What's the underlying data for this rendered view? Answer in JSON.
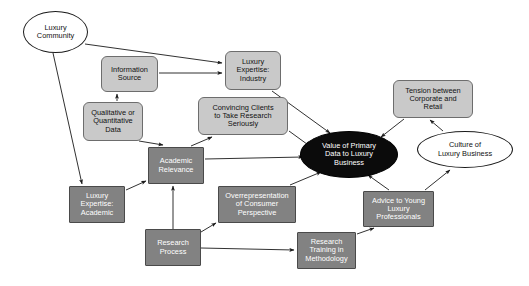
{
  "diagram": {
    "width": 529,
    "height": 286,
    "background": "#ffffff",
    "colors": {
      "box_light_fill": "#c9c9c9",
      "box_light_stroke": "#6d6d6d",
      "box_dark_fill": "#828282",
      "box_dark_stroke": "#4a4a4a",
      "ellipse_light_fill": "#ffffff",
      "ellipse_light_stroke": "#1a1a1a",
      "ellipse_dark_fill": "#0b0b0b",
      "text_dark": "#111111",
      "text_light": "#ffffff",
      "edge_stroke": "#1a1a1a"
    },
    "nodes": [
      {
        "id": "luxury-community",
        "label": "Luxury\nCommunity",
        "shape": "ellipse",
        "style": "ellipse-light",
        "x": 23,
        "y": 11,
        "w": 65,
        "h": 42
      },
      {
        "id": "information-source",
        "label": "Information\nSource",
        "shape": "rounded-rect",
        "style": "box-light",
        "x": 101,
        "y": 56,
        "w": 57,
        "h": 36
      },
      {
        "id": "qualitative-or-quantitative-data",
        "label": "Qualitative or\nQuantitative\nData",
        "shape": "rounded-rect",
        "style": "box-light",
        "x": 83,
        "y": 102,
        "w": 60,
        "h": 39
      },
      {
        "id": "luxury-expertise-industry",
        "label": "Luxury\nExpertise:\nIndustry",
        "shape": "rounded-rect",
        "style": "box-light",
        "x": 225,
        "y": 51,
        "w": 56,
        "h": 39
      },
      {
        "id": "convincing-clients",
        "label": "Convincing Clients\nto Take Research\nSeriously",
        "shape": "rounded-rect",
        "style": "box-light",
        "x": 198,
        "y": 97,
        "w": 90,
        "h": 38
      },
      {
        "id": "tension-between-corporate-and-retail",
        "label": "Tension between\nCorporate and\nRetail",
        "shape": "rounded-rect",
        "style": "box-light",
        "x": 393,
        "y": 80,
        "w": 80,
        "h": 38
      },
      {
        "id": "value-of-primary-data",
        "label": "Value of Primary\nData to Luxury\nBusiness",
        "shape": "ellipse",
        "style": "ellipse-dark",
        "x": 300,
        "y": 131,
        "w": 98,
        "h": 47
      },
      {
        "id": "culture-of-luxury-business",
        "label": "Culture of\nLuxury Business",
        "shape": "ellipse",
        "style": "ellipse-light",
        "x": 417,
        "y": 131,
        "w": 96,
        "h": 37
      },
      {
        "id": "academic-relevance",
        "label": "Academic\nRelevance",
        "shape": "rect",
        "style": "box-dark",
        "x": 148,
        "y": 147,
        "w": 56,
        "h": 37
      },
      {
        "id": "luxury-expertise-academic",
        "label": "Luxury\nExpertise:\nAcademic",
        "shape": "rect",
        "style": "box-dark",
        "x": 69,
        "y": 186,
        "w": 56,
        "h": 37
      },
      {
        "id": "overrepresentation-of-consumer-perspective",
        "label": "Overrepresentation\nof Consumer\nPerspective",
        "shape": "rect",
        "style": "box-dark",
        "x": 218,
        "y": 186,
        "w": 78,
        "h": 37
      },
      {
        "id": "advice-to-young-luxury-professionals",
        "label": "Advice to Young\nLuxury\nProfessionals",
        "shape": "rect",
        "style": "box-dark",
        "x": 363,
        "y": 191,
        "w": 71,
        "h": 36
      },
      {
        "id": "research-process",
        "label": "Research\nProcess",
        "shape": "rect",
        "style": "box-dark",
        "x": 145,
        "y": 229,
        "w": 56,
        "h": 37
      },
      {
        "id": "research-training-in-methodology",
        "label": "Research\nTraining in\nMethodology",
        "shape": "rect",
        "style": "box-dark",
        "x": 297,
        "y": 232,
        "w": 59,
        "h": 37
      }
    ],
    "edges": [
      {
        "id": "edge-luxury-community-to-luxury-expertise-industry",
        "from": "luxury-community",
        "to": "luxury-expertise-industry",
        "path": "M 85,44 L 222,63",
        "arrow": true
      },
      {
        "id": "edge-luxury-community-to-luxury-expertise-academic",
        "from": "luxury-community",
        "to": "luxury-expertise-academic",
        "path": "M 53,53 L 82,184",
        "arrow": true
      },
      {
        "id": "edge-information-source-to-luxury-expertise-industry",
        "from": "information-source",
        "to": "luxury-expertise-industry",
        "path": "M 159,73 L 222,73",
        "arrow": true
      },
      {
        "id": "edge-qualitative-data-to-information-source",
        "from": "qualitative-or-quantitative-data",
        "to": "information-source",
        "path": "M 117,101 L 117,94",
        "arrow": true
      },
      {
        "id": "edge-qualitative-data-to-academic-relevance",
        "from": "qualitative-or-quantitative-data",
        "to": "academic-relevance",
        "path": "M 139,141 L 163,145",
        "arrow": true
      },
      {
        "id": "edge-luxury-expertise-industry-to-value",
        "from": "luxury-expertise-industry",
        "to": "value-of-primary-data",
        "path": "M 272,91 L 330,133",
        "arrow": true
      },
      {
        "id": "edge-convincing-clients-to-value",
        "from": "convincing-clients",
        "to": "value-of-primary-data",
        "path": "M 289,131 L 311,147",
        "arrow": true
      },
      {
        "id": "edge-academic-relevance-to-convincing-clients",
        "from": "academic-relevance",
        "to": "convincing-clients",
        "path": "M 191,146 L 212,137",
        "arrow": true
      },
      {
        "id": "edge-academic-relevance-to-value",
        "from": "academic-relevance",
        "to": "value-of-primary-data",
        "path": "M 205,159 L 303,157",
        "arrow": true
      },
      {
        "id": "edge-luxury-expertise-academic-to-academic-relevance",
        "from": "luxury-expertise-academic",
        "to": "academic-relevance",
        "path": "M 126,190 L 146,181",
        "arrow": true
      },
      {
        "id": "edge-research-process-to-academic-relevance",
        "from": "research-process",
        "to": "academic-relevance",
        "path": "M 173,229 L 173,186",
        "arrow": true
      },
      {
        "id": "edge-research-process-to-overrepresentation",
        "from": "research-process",
        "to": "overrepresentation-of-consumer-perspective",
        "path": "M 201,232 L 216,223",
        "arrow": true
      },
      {
        "id": "edge-research-process-to-research-training",
        "from": "research-process",
        "to": "research-training-in-methodology",
        "path": "M 201,248 L 294,250",
        "arrow": true
      },
      {
        "id": "edge-overrepresentation-to-value",
        "from": "overrepresentation-of-consumer-perspective",
        "to": "value-of-primary-data",
        "path": "M 290,185 L 321,172",
        "arrow": true
      },
      {
        "id": "edge-research-training-to-advice",
        "from": "research-training-in-methodology",
        "to": "advice-to-young-luxury-professionals",
        "path": "M 357,234 L 374,228",
        "arrow": true
      },
      {
        "id": "edge-advice-to-value",
        "from": "advice-to-young-luxury-professionals",
        "to": "value-of-primary-data",
        "path": "M 389,190 L 368,175",
        "arrow": true
      },
      {
        "id": "edge-advice-to-culture",
        "from": "advice-to-young-luxury-professionals",
        "to": "culture-of-luxury-business",
        "path": "M 425,190 L 450,170",
        "arrow": true
      },
      {
        "id": "edge-tension-to-value",
        "from": "tension-between-corporate-and-retail",
        "to": "value-of-primary-data",
        "path": "M 404,119 L 381,137",
        "arrow": true
      },
      {
        "id": "edge-culture-to-tension",
        "from": "culture-of-luxury-business",
        "to": "tension-between-corporate-and-retail",
        "path": "M 443,131 L 430,120",
        "arrow": true
      }
    ]
  }
}
